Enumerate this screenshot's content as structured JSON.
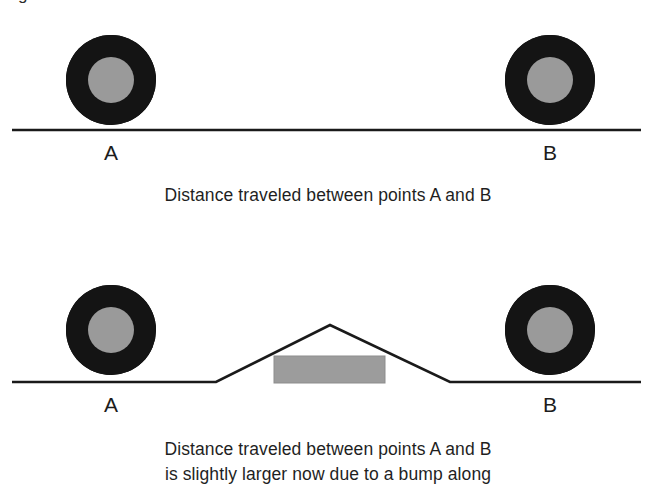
{
  "figure": {
    "cropped_top_glyph": "g",
    "background_color": "#ffffff",
    "ink_color": "#1a1a1a",
    "tire_color": "#141414",
    "hub_color": "#9a9a9a",
    "block_color": "#9c9c9c"
  },
  "panels": [
    {
      "id": "flat-ground-panel",
      "wheels": [
        {
          "label": "A",
          "cx": 111,
          "cy": 80,
          "r_outer": 45,
          "r_inner": 23
        },
        {
          "label": "B",
          "cx": 550,
          "cy": 80,
          "r_outer": 45,
          "r_inner": 23
        }
      ],
      "ground": {
        "y": 130,
        "x_start": 12,
        "x_end": 641,
        "type": "flat"
      },
      "caption": [
        "Distance traveled between points A and B"
      ]
    },
    {
      "id": "bump-ground-panel",
      "wheels": [
        {
          "label": "A",
          "cx": 111,
          "cy": 80,
          "r_outer": 45,
          "r_inner": 23
        },
        {
          "label": "B",
          "cx": 550,
          "cy": 80,
          "r_outer": 45,
          "r_inner": 23
        }
      ],
      "ground": {
        "y": 132,
        "x_start": 12,
        "x_end": 641,
        "type": "bump",
        "bump_left_base_x": 216,
        "bump_peak_x": 330,
        "bump_peak_y": 75,
        "bump_right_base_x": 450
      },
      "block": {
        "x": 274,
        "y": 106,
        "width": 111,
        "height": 27
      },
      "caption": [
        "Distance traveled between points A and B",
        "is slightly larger now due to a bump along"
      ]
    }
  ]
}
